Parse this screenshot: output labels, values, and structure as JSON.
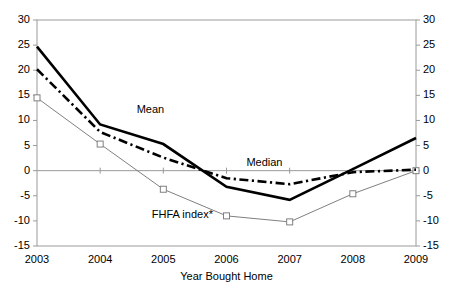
{
  "chart_data": {
    "type": "line",
    "title": "",
    "xlabel": "Year Bought Home",
    "ylabel": "",
    "x": [
      2003,
      2004,
      2005,
      2006,
      2007,
      2008,
      2009
    ],
    "categories": [
      "2003",
      "2004",
      "2005",
      "2006",
      "2007",
      "2008",
      "2009"
    ],
    "xlim": [
      2003,
      2009
    ],
    "ylim": [
      -15,
      30
    ],
    "yticks": [
      30,
      25,
      20,
      15,
      10,
      5,
      0,
      -5,
      -10,
      -15
    ],
    "ytick_labels_left": [
      "30",
      "25",
      "20",
      "15",
      "10",
      "5",
      "0",
      "-5",
      "-10",
      "-15"
    ],
    "ytick_labels_right": [
      "30",
      "25",
      "20",
      "15",
      "10",
      "5",
      "0",
      "-5",
      "-10",
      "-15"
    ],
    "dual_y_axis": true,
    "grid": false,
    "zero_line": true,
    "legend": "inline-annotations",
    "series": [
      {
        "name": "Mean",
        "style": "solid-thick",
        "color": "#000000",
        "markers": "none",
        "values": [
          24.7,
          9.2,
          5.3,
          -3.2,
          -5.8,
          0.3,
          6.5
        ],
        "label": "Mean",
        "label_x": 2004.8,
        "label_y": 12.0
      },
      {
        "name": "Median",
        "style": "dash-dot",
        "color": "#000000",
        "markers": "none",
        "values": [
          20.2,
          7.7,
          2.6,
          -1.5,
          -2.7,
          -0.3,
          0.2
        ],
        "label": "Median",
        "label_x": 2006.6,
        "label_y": 1.6
      },
      {
        "name": "FHFA index*",
        "style": "solid-thin",
        "color": "#808080",
        "markers": "square",
        "values": [
          14.5,
          5.3,
          -3.7,
          -9.0,
          -10.2,
          -4.6,
          0.0
        ],
        "label": "FHFA index*",
        "label_x": 2005.3,
        "label_y": -8.9
      }
    ]
  }
}
